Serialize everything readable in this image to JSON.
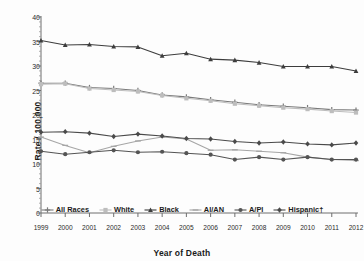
{
  "chart_data": {
    "type": "line",
    "title": "",
    "xlabel": "Year of Death",
    "ylabel": "Rate / 100,000",
    "x": [
      1999,
      2000,
      2001,
      2002,
      2003,
      2004,
      2005,
      2006,
      2007,
      2008,
      2009,
      2010,
      2011,
      2012
    ],
    "xtick_labels": [
      "1999",
      "2000",
      "2001",
      "2002",
      "2003",
      "2004",
      "2005",
      "2006",
      "2007",
      "2008",
      "2009",
      "2010",
      "2011",
      "2012"
    ],
    "ytick_labels": [
      "0",
      "5",
      "10",
      "15",
      "20",
      "25",
      "30",
      "35",
      "40"
    ],
    "yticks": [
      0,
      5,
      10,
      15,
      20,
      25,
      30,
      35,
      40
    ],
    "ylim": [
      0,
      40
    ],
    "xlim": [
      1999,
      2012
    ],
    "grid": false,
    "legend_position": "bottom",
    "series": [
      {
        "name": "All Races",
        "color": "#7a7a7a",
        "marker": "plus",
        "values": [
          26.5,
          26.5,
          25.6,
          25.4,
          25.0,
          24.1,
          23.7,
          23.1,
          22.6,
          22.1,
          21.8,
          21.5,
          21.1,
          21.0
        ]
      },
      {
        "name": "White",
        "color": "#bdbdbd",
        "marker": "square",
        "values": [
          26.3,
          26.4,
          25.4,
          25.1,
          24.8,
          24.0,
          23.4,
          22.9,
          22.3,
          21.9,
          21.5,
          21.2,
          20.8,
          20.5
        ]
      },
      {
        "name": "Black",
        "color": "#3d3d3d",
        "marker": "triangle",
        "values": [
          35.2,
          34.3,
          34.4,
          34.0,
          33.9,
          32.1,
          32.6,
          31.4,
          31.2,
          30.7,
          29.9,
          29.9,
          29.9,
          29.0
        ]
      },
      {
        "name": "AI/AN",
        "color": "#a6a6a6",
        "marker": "dash",
        "values": [
          15.5,
          13.8,
          12.3,
          13.6,
          14.7,
          15.5,
          15.1,
          12.8,
          12.9,
          12.6,
          12.3,
          11.4,
          10.9,
          10.7
        ]
      },
      {
        "name": "A/PI",
        "color": "#545454",
        "marker": "circle",
        "values": [
          12.6,
          12.0,
          12.4,
          12.8,
          12.4,
          12.5,
          12.2,
          11.9,
          10.9,
          11.4,
          10.9,
          11.4,
          10.9,
          10.9
        ]
      },
      {
        "name": "Hispanic†",
        "color": "#4a4a4a",
        "marker": "diamond",
        "values": [
          16.5,
          16.6,
          16.3,
          15.6,
          16.1,
          15.7,
          15.2,
          15.1,
          14.6,
          14.3,
          14.5,
          14.1,
          13.9,
          14.3
        ]
      }
    ]
  },
  "legend": {
    "items": [
      {
        "label": "All Races"
      },
      {
        "label": "White"
      },
      {
        "label": "Black"
      },
      {
        "label": "AI/AN"
      },
      {
        "label": "A/PI"
      },
      {
        "label": "Hispanic†"
      }
    ]
  }
}
